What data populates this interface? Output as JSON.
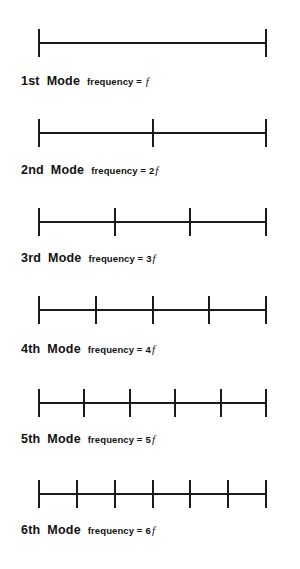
{
  "figure": {
    "line": {
      "left_px": 39,
      "right_px": 266,
      "color": "#1a1a1a"
    },
    "modes": [
      {
        "ordinal": "1st",
        "mode_word": "Mode",
        "freq_text": "frequency =",
        "freq_multiplier": "",
        "freq_symbol": "f",
        "segments": 1,
        "node_count": 2,
        "diagram_top": 28,
        "caption_top": 74,
        "caption_left": 21
      },
      {
        "ordinal": "2nd",
        "mode_word": "Mode",
        "freq_text": "frequency =",
        "freq_multiplier": "2",
        "freq_symbol": "f",
        "segments": 2,
        "node_count": 3,
        "diagram_top": 118,
        "caption_top": 163,
        "caption_left": 21
      },
      {
        "ordinal": "3rd",
        "mode_word": "Mode",
        "freq_text": "frequency =",
        "freq_multiplier": "3 ",
        "freq_symbol": "f",
        "segments": 3,
        "node_count": 4,
        "diagram_top": 207,
        "caption_top": 251,
        "caption_left": 21
      },
      {
        "ordinal": "4th",
        "mode_word": "Mode",
        "freq_text": "frequency =",
        "freq_multiplier": "4",
        "freq_symbol": "f",
        "segments": 4,
        "node_count": 5,
        "diagram_top": 295,
        "caption_top": 342,
        "caption_left": 21
      },
      {
        "ordinal": "5th",
        "mode_word": "Mode",
        "freq_text": "frequency =",
        "freq_multiplier": "5",
        "freq_symbol": "f",
        "segments": 5,
        "node_count": 6,
        "diagram_top": 388,
        "caption_top": 432,
        "caption_left": 21
      },
      {
        "ordinal": "6th",
        "mode_word": "Mode",
        "freq_text": "frequency =",
        "freq_multiplier": "6",
        "freq_symbol": "f",
        "segments": 6,
        "node_count": 7,
        "diagram_top": 479,
        "caption_top": 523,
        "caption_left": 21
      }
    ]
  },
  "chart_data": {
    "type": "diagram",
    "xlabel": "",
    "ylabel": "",
    "categories": [
      "1st Mode",
      "2nd Mode",
      "3rd Mode",
      "4th Mode",
      "5th Mode",
      "6th Mode"
    ],
    "series": [
      {
        "name": "Number of segments (antinodes)",
        "values": [
          1,
          2,
          3,
          4,
          5,
          6
        ]
      },
      {
        "name": "Number of nodes (tick marks)",
        "values": [
          2,
          3,
          4,
          5,
          6,
          7
        ]
      },
      {
        "name": "Frequency (multiples of f)",
        "values": [
          1,
          2,
          3,
          4,
          5,
          6
        ]
      }
    ],
    "annotations": [
      "1st Mode frequency = f",
      "2nd Mode frequency = 2f",
      "3rd Mode frequency =3 f",
      "4th Mode frequency = 4f",
      "5th Mode frequency = 5f",
      "6th Mode frequency = 6f"
    ]
  }
}
